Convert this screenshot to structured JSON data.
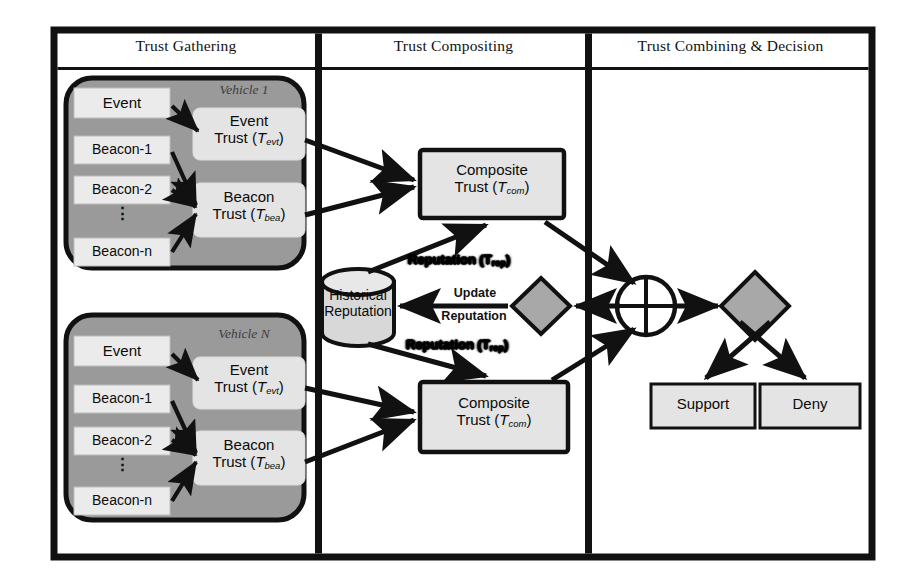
{
  "diagram": {
    "columns": [
      {
        "id": "gathering",
        "label": "Trust Gathering"
      },
      {
        "id": "compositing",
        "label": "Trust Compositing"
      },
      {
        "id": "combining",
        "label": "Trust Combining & Decision"
      }
    ],
    "vehicles": [
      {
        "id": "vehicle-1",
        "tag_prefix": "Vehicle ",
        "tag_index": "1",
        "inputs": [
          {
            "label": "Event"
          },
          {
            "label": "Beacon-1"
          },
          {
            "label": "Beacon-2"
          },
          {
            "label": "Beacon-n"
          }
        ],
        "ellipsis": "⋮",
        "trusts": [
          {
            "id": "event-trust",
            "line1": "Event",
            "line2": "Trust (",
            "symbol": "T",
            "sub": "evt",
            "line2_end": ")"
          },
          {
            "id": "beacon-trust",
            "line1": "Beacon",
            "line2": "Trust (",
            "symbol": "T",
            "sub": "bea",
            "line2_end": ")"
          }
        ]
      },
      {
        "id": "vehicle-n",
        "tag_prefix": "Vehicle ",
        "tag_index": "N",
        "inputs": [
          {
            "label": "Event"
          },
          {
            "label": "Beacon-1"
          },
          {
            "label": "Beacon-2"
          },
          {
            "label": "Beacon-n"
          }
        ],
        "ellipsis": "⋮",
        "trusts": [
          {
            "id": "event-trust",
            "line1": "Event",
            "line2": "Trust (",
            "symbol": "T",
            "sub": "evt",
            "line2_end": ")"
          },
          {
            "id": "beacon-trust",
            "line1": "Beacon",
            "line2": "Trust (",
            "symbol": "T",
            "sub": "bea",
            "line2_end": ")"
          }
        ]
      }
    ],
    "composite": [
      {
        "id": "composite-trust-1",
        "line1": "Composite",
        "line2": "Trust (",
        "symbol": "T",
        "sub": "com",
        "line2_end": ")"
      },
      {
        "id": "composite-trust-2",
        "line1": "Composite",
        "line2": "Trust (",
        "symbol": "T",
        "sub": "com",
        "line2_end": ")"
      }
    ],
    "database": {
      "id": "historical-reputation",
      "line1": "Historical",
      "line2": "Reputation"
    },
    "edge_labels": {
      "reputation_top": {
        "text": "Reputation (",
        "symbol": "T",
        "sub": "rep",
        "text_end": ")"
      },
      "reputation_bottom": {
        "text": "Reputation (",
        "symbol": "T",
        "sub": "rep",
        "text_end": ")"
      },
      "update": "Update",
      "reputation": "Reputation"
    },
    "nodes": {
      "update_diamond": {
        "id": "update-reputation-diamond"
      },
      "sum_circle": {
        "id": "trust-combining-sum"
      },
      "decision_diamond": {
        "id": "decision-diamond"
      }
    },
    "decisions": [
      {
        "id": "support",
        "label": "Support"
      },
      {
        "id": "deny",
        "label": "Deny"
      }
    ],
    "colors": {
      "frame": "#111111",
      "vehicle_fill": "#9a9a9a",
      "box_fill": "#ebebeb",
      "trust_fill": "#e4e4e4",
      "shape_fill": "#a8a8a8",
      "stroke": "#111111",
      "page_bg": "#ffffff"
    }
  }
}
